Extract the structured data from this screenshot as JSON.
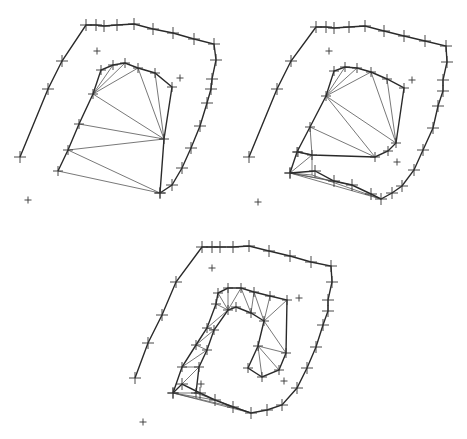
{
  "diagram": {
    "type": "progressive-triangulation",
    "background": "#ffffff",
    "colors": {
      "bold_edge": "#2a2a2a",
      "thin_edge": "#555555",
      "marker": "#333333"
    },
    "panels": [
      {
        "name": "panel-1",
        "outer_curve": [
          [
            20,
            157
          ],
          [
            48,
            89
          ],
          [
            62,
            61
          ],
          [
            86,
            25
          ],
          [
            96,
            25
          ],
          [
            104,
            26
          ],
          [
            117,
            25
          ],
          [
            134,
            24
          ],
          [
            153,
            29
          ],
          [
            173,
            33
          ],
          [
            194,
            39
          ],
          [
            214,
            44
          ],
          [
            216,
            60
          ],
          [
            212,
            79
          ],
          [
            211,
            89
          ],
          [
            207,
            103
          ],
          [
            200,
            126
          ],
          [
            191,
            148
          ],
          [
            182,
            168
          ],
          [
            172,
            185
          ],
          [
            160,
            193
          ]
        ],
        "inner_loop": [
          [
            58,
            171
          ],
          [
            68,
            150
          ],
          [
            79,
            124
          ],
          [
            93,
            94
          ],
          [
            101,
            70
          ],
          [
            113,
            65
          ],
          [
            125,
            63
          ],
          [
            138,
            68
          ],
          [
            155,
            73
          ],
          [
            172,
            87
          ],
          [
            164,
            139
          ],
          [
            160,
            193
          ]
        ],
        "fan_edges": [
          [
            [
              93,
              94
            ],
            [
              113,
              65
            ]
          ],
          [
            [
              93,
              94
            ],
            [
              125,
              63
            ]
          ],
          [
            [
              93,
              94
            ],
            [
              138,
              68
            ]
          ],
          [
            [
              93,
              94
            ],
            [
              164,
              139
            ]
          ],
          [
            [
              138,
              68
            ],
            [
              164,
              139
            ]
          ],
          [
            [
              155,
              73
            ],
            [
              164,
              139
            ]
          ],
          [
            [
              79,
              124
            ],
            [
              164,
              139
            ]
          ],
          [
            [
              68,
              150
            ],
            [
              164,
              139
            ]
          ],
          [
            [
              68,
              150
            ],
            [
              160,
              193
            ]
          ],
          [
            [
              58,
              171
            ],
            [
              160,
              193
            ]
          ]
        ],
        "stray_points": [
          [
            97,
            51
          ],
          [
            180,
            78
          ],
          [
            28,
            200
          ]
        ]
      },
      {
        "name": "panel-2",
        "outer_curve": [
          [
            249,
            157
          ],
          [
            277,
            89
          ],
          [
            291,
            61
          ],
          [
            316,
            27
          ],
          [
            326,
            27
          ],
          [
            334,
            28
          ],
          [
            349,
            27
          ],
          [
            365,
            26
          ],
          [
            384,
            31
          ],
          [
            404,
            36
          ],
          [
            425,
            41
          ],
          [
            446,
            46
          ],
          [
            447,
            62
          ],
          [
            443,
            80
          ],
          [
            443,
            91
          ],
          [
            438,
            106
          ],
          [
            433,
            128
          ],
          [
            423,
            150
          ],
          [
            414,
            170
          ],
          [
            402,
            186
          ],
          [
            392,
            193
          ],
          [
            381,
            199
          ],
          [
            371,
            194
          ],
          [
            352,
            185
          ],
          [
            334,
            181
          ],
          [
            315,
            171
          ],
          [
            290,
            173
          ]
        ],
        "inner_loop": [
          [
            290,
            173
          ],
          [
            297,
            152
          ],
          [
            310,
            127
          ],
          [
            326,
            96
          ],
          [
            334,
            71
          ],
          [
            345,
            67
          ],
          [
            357,
            68
          ],
          [
            371,
            72
          ],
          [
            387,
            79
          ],
          [
            404,
            88
          ],
          [
            396,
            143
          ],
          [
            388,
            151
          ],
          [
            375,
            157
          ],
          [
            312,
            155
          ],
          [
            298,
            152
          ]
        ],
        "fan_edges": [
          [
            [
              326,
              96
            ],
            [
              345,
              67
            ]
          ],
          [
            [
              326,
              96
            ],
            [
              357,
              68
            ]
          ],
          [
            [
              326,
              96
            ],
            [
              371,
              72
            ]
          ],
          [
            [
              326,
              96
            ],
            [
              396,
              143
            ]
          ],
          [
            [
              326,
              96
            ],
            [
              375,
              157
            ]
          ],
          [
            [
              371,
              72
            ],
            [
              396,
              143
            ]
          ],
          [
            [
              387,
              79
            ],
            [
              396,
              143
            ]
          ],
          [
            [
              310,
              127
            ],
            [
              375,
              157
            ]
          ],
          [
            [
              310,
              127
            ],
            [
              312,
              155
            ]
          ],
          [
            [
              312,
              155
            ],
            [
              312,
              175
            ]
          ],
          [
            [
              297,
              152
            ],
            [
              312,
              155
            ]
          ],
          [
            [
              290,
              173
            ],
            [
              312,
              155
            ]
          ],
          [
            [
              290,
              173
            ],
            [
              312,
              175
            ]
          ],
          [
            [
              290,
              173
            ],
            [
              334,
              181
            ]
          ],
          [
            [
              290,
              173
            ],
            [
              352,
              185
            ]
          ],
          [
            [
              290,
              173
            ],
            [
              381,
              199
            ]
          ],
          [
            [
              312,
              175
            ],
            [
              381,
              199
            ]
          ]
        ],
        "stray_points": [
          [
            329,
            51
          ],
          [
            412,
            80
          ],
          [
            397,
            162
          ],
          [
            258,
            202
          ]
        ]
      },
      {
        "name": "panel-3",
        "outer_curve": [
          [
            135,
            378
          ],
          [
            148,
            343
          ],
          [
            162,
            315
          ],
          [
            176,
            282
          ],
          [
            202,
            247
          ],
          [
            212,
            247
          ],
          [
            220,
            247
          ],
          [
            233,
            247
          ],
          [
            249,
            246
          ],
          [
            269,
            251
          ],
          [
            290,
            256
          ],
          [
            311,
            262
          ],
          [
            331,
            266
          ],
          [
            332,
            282
          ],
          [
            328,
            300
          ],
          [
            328,
            311
          ],
          [
            323,
            325
          ],
          [
            316,
            347
          ],
          [
            307,
            368
          ],
          [
            297,
            388
          ],
          [
            282,
            405
          ],
          [
            267,
            410
          ],
          [
            251,
            413
          ],
          [
            233,
            407
          ],
          [
            215,
            400
          ],
          [
            200,
            393
          ],
          [
            182,
            384
          ],
          [
            173,
            393
          ]
        ],
        "inner_loop": [
          [
            173,
            393
          ],
          [
            182,
            367
          ],
          [
            196,
            345
          ],
          [
            207,
            328
          ],
          [
            216,
            304
          ],
          [
            218,
            293
          ],
          [
            228,
            288
          ],
          [
            241,
            288
          ],
          [
            254,
            292
          ],
          [
            270,
            296
          ],
          [
            287,
            300
          ],
          [
            286,
            353
          ],
          [
            279,
            370
          ],
          [
            262,
            377
          ],
          [
            248,
            368
          ],
          [
            258,
            346
          ],
          [
            264,
            321
          ],
          [
            251,
            313
          ],
          [
            236,
            307
          ],
          [
            228,
            310
          ],
          [
            214,
            330
          ],
          [
            207,
            350
          ],
          [
            199,
            367
          ],
          [
            196,
            393
          ]
        ],
        "fan_edges": [
          [
            [
              216,
              304
            ],
            [
              228,
              310
            ]
          ],
          [
            [
              218,
              293
            ],
            [
              228,
              310
            ]
          ],
          [
            [
              228,
              288
            ],
            [
              228,
              310
            ]
          ],
          [
            [
              241,
              288
            ],
            [
              228,
              310
            ]
          ],
          [
            [
              241,
              288
            ],
            [
              251,
              313
            ]
          ],
          [
            [
              254,
              292
            ],
            [
              251,
              313
            ]
          ],
          [
            [
              254,
              292
            ],
            [
              264,
              321
            ]
          ],
          [
            [
              270,
              296
            ],
            [
              264,
              321
            ]
          ],
          [
            [
              287,
              300
            ],
            [
              264,
              321
            ]
          ],
          [
            [
              264,
              321
            ],
            [
              286,
              353
            ]
          ],
          [
            [
              258,
              346
            ],
            [
              286,
              353
            ]
          ],
          [
            [
              258,
              346
            ],
            [
              279,
              370
            ]
          ],
          [
            [
              258,
              346
            ],
            [
              262,
              377
            ]
          ],
          [
            [
              207,
              328
            ],
            [
              228,
              310
            ]
          ],
          [
            [
              207,
              328
            ],
            [
              214,
              330
            ]
          ],
          [
            [
              196,
              345
            ],
            [
              214,
              330
            ]
          ],
          [
            [
              196,
              345
            ],
            [
              207,
              350
            ]
          ],
          [
            [
              182,
              367
            ],
            [
              207,
              350
            ]
          ],
          [
            [
              182,
              367
            ],
            [
              199,
              367
            ]
          ],
          [
            [
              173,
              393
            ],
            [
              199,
              367
            ]
          ],
          [
            [
              173,
              393
            ],
            [
              196,
              393
            ]
          ],
          [
            [
              173,
              393
            ],
            [
              215,
              400
            ]
          ],
          [
            [
              173,
              393
            ],
            [
              233,
              407
            ]
          ],
          [
            [
              173,
              393
            ],
            [
              251,
              413
            ]
          ],
          [
            [
              196,
              393
            ],
            [
              251,
              413
            ]
          ]
        ],
        "stray_points": [
          [
            212,
            268
          ],
          [
            299,
            298
          ],
          [
            201,
            384
          ],
          [
            284,
            381
          ],
          [
            143,
            422
          ]
        ]
      }
    ]
  }
}
